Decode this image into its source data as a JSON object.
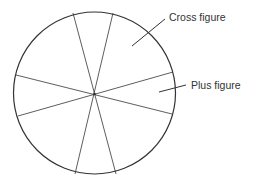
{
  "diagram": {
    "type": "sectored-circle",
    "stroke_color": "#333333",
    "background": "#ffffff",
    "circle": {
      "cx": 94.5,
      "cy": 93,
      "r": 81
    },
    "center_dot": {
      "cx": 94.5,
      "cy": 94
    },
    "spokes": [
      {
        "x1": 73,
        "y1": 13,
        "x2": 116,
        "y2": 174
      },
      {
        "x1": 113,
        "y1": 13,
        "x2": 75,
        "y2": 174
      },
      {
        "x1": 16,
        "y1": 75,
        "x2": 172,
        "y2": 114
      },
      {
        "x1": 18,
        "y1": 116,
        "x2": 173,
        "y2": 72
      }
    ],
    "sector_count": 8,
    "labels": [
      {
        "text": "Cross figure",
        "pointer": {
          "x1": 132,
          "y1": 46,
          "x2": 165,
          "y2": 19
        }
      },
      {
        "text": "Plus figure",
        "pointer": {
          "x1": 159,
          "y1": 92,
          "x2": 186,
          "y2": 85
        }
      }
    ]
  }
}
